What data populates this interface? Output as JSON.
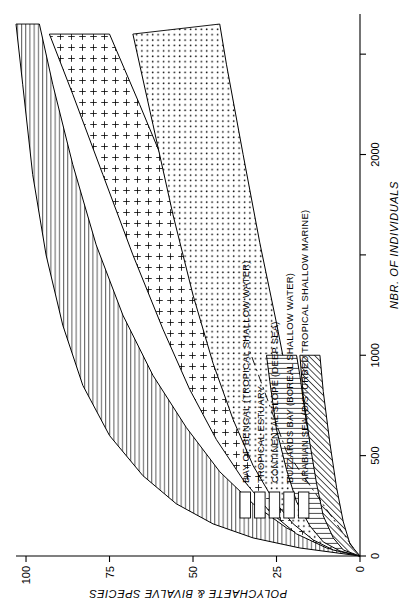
{
  "figure": {
    "title": "",
    "orientation": "rotated-90-ccw"
  },
  "chart_data": {
    "type": "line",
    "title": "",
    "subtitle": "",
    "xlabel": "NBR. OF INDIVIDUALS",
    "ylabel": "POLYCHAETE & BIVALVE SPECIES",
    "xlim": [
      0,
      2700
    ],
    "ylim": [
      0,
      103
    ],
    "grid": false,
    "legend_position": "inside-lower-left",
    "xticks": [
      0,
      500,
      1000,
      1500,
      2000,
      2500
    ],
    "xtick_labels": [
      "0",
      "500",
      "1000",
      "",
      "2000",
      ""
    ],
    "yticks": [
      0,
      25,
      50,
      75,
      100
    ],
    "ytick_labels": [
      "0",
      "25",
      "50",
      "75",
      "100"
    ],
    "series": [
      {
        "name": "BAY OF BENGAL (TROPICAL SHALLOW WATER)",
        "pattern": "horizontal-lines",
        "upper": [
          [
            0,
            0
          ],
          [
            40,
            18
          ],
          [
            90,
            32
          ],
          [
            160,
            44
          ],
          [
            260,
            55
          ],
          [
            400,
            65
          ],
          [
            600,
            75
          ],
          [
            850,
            83
          ],
          [
            1150,
            89
          ],
          [
            1500,
            94
          ],
          [
            1900,
            98
          ],
          [
            2350,
            101
          ],
          [
            2650,
            103
          ]
        ],
        "lower": [
          [
            0,
            0
          ],
          [
            60,
            12
          ],
          [
            140,
            22
          ],
          [
            260,
            32
          ],
          [
            420,
            42
          ],
          [
            640,
            52
          ],
          [
            900,
            62
          ],
          [
            1200,
            71
          ],
          [
            1550,
            79
          ],
          [
            1950,
            86
          ],
          [
            2350,
            92
          ],
          [
            2650,
            96
          ]
        ]
      },
      {
        "name": "TROPICAL ESTUARY",
        "pattern": "plus-signs",
        "upper": [
          [
            0,
            0
          ],
          [
            40,
            10
          ],
          [
            110,
            19
          ],
          [
            220,
            27
          ],
          [
            380,
            35
          ],
          [
            580,
            43
          ],
          [
            830,
            51
          ],
          [
            1130,
            59
          ],
          [
            1500,
            68
          ],
          [
            1900,
            77
          ],
          [
            2300,
            86
          ],
          [
            2600,
            93
          ]
        ],
        "lower": [
          [
            0,
            0
          ],
          [
            70,
            7
          ],
          [
            180,
            13
          ],
          [
            340,
            19
          ],
          [
            550,
            25
          ],
          [
            800,
            32
          ],
          [
            1100,
            39
          ],
          [
            1450,
            47
          ],
          [
            1850,
            56
          ],
          [
            2250,
            66
          ],
          [
            2600,
            75
          ]
        ]
      },
      {
        "name": "CONTINENTAL SLOPE (DEEP SEA)",
        "pattern": "dots",
        "upper": [
          [
            0,
            0
          ],
          [
            30,
            8
          ],
          [
            80,
            14
          ],
          [
            160,
            20
          ],
          [
            280,
            26
          ],
          [
            450,
            32
          ],
          [
            680,
            38
          ],
          [
            960,
            44
          ],
          [
            1300,
            50
          ],
          [
            1700,
            56
          ],
          [
            2150,
            62
          ],
          [
            2600,
            68
          ]
        ],
        "lower": [
          [
            0,
            0
          ],
          [
            60,
            5
          ],
          [
            160,
            9
          ],
          [
            320,
            13
          ],
          [
            540,
            17
          ],
          [
            820,
            21
          ],
          [
            1160,
            25
          ],
          [
            1560,
            30
          ],
          [
            2000,
            35
          ],
          [
            2450,
            40
          ],
          [
            2650,
            42
          ]
        ]
      },
      {
        "name": "BUZZARDS BAY (BOREAL SHALLOW WATER)",
        "pattern": "vertical-lines",
        "upper": [
          [
            0,
            0
          ],
          [
            25,
            6
          ],
          [
            70,
            11
          ],
          [
            150,
            15
          ],
          [
            270,
            19
          ],
          [
            430,
            22
          ],
          [
            630,
            25
          ],
          [
            870,
            27
          ],
          [
            1000,
            28
          ]
        ],
        "lower": [
          [
            0,
            0
          ],
          [
            50,
            4
          ],
          [
            130,
            7
          ],
          [
            260,
            10
          ],
          [
            440,
            13
          ],
          [
            660,
            16
          ],
          [
            900,
            18
          ],
          [
            1000,
            19
          ]
        ]
      },
      {
        "name": "ARABIAN SEA (DISTURBED TROPICAL SHALLOW MARINE)",
        "pattern": "diagonal-hatch",
        "upper": [
          [
            0,
            0
          ],
          [
            30,
            5
          ],
          [
            90,
            8
          ],
          [
            200,
            11
          ],
          [
            360,
            13
          ],
          [
            560,
            15
          ],
          [
            800,
            17
          ],
          [
            1000,
            18
          ]
        ],
        "lower": [
          [
            0,
            0
          ],
          [
            60,
            3
          ],
          [
            170,
            5
          ],
          [
            340,
            7
          ],
          [
            560,
            9
          ],
          [
            820,
            11
          ],
          [
            1000,
            12
          ]
        ]
      }
    ]
  },
  "axes": {
    "x": {
      "label": "NBR. OF INDIVIDUALS",
      "ticks": [
        {
          "value": 0,
          "label": "0"
        },
        {
          "value": 500,
          "label": "500"
        },
        {
          "value": 1000,
          "label": "1000"
        },
        {
          "value": 1500,
          "label": ""
        },
        {
          "value": 2000,
          "label": "2000"
        },
        {
          "value": 2500,
          "label": ""
        }
      ]
    },
    "y": {
      "label": "POLYCHAETE & BIVALVE SPECIES",
      "ticks": [
        {
          "value": 0,
          "label": "0"
        },
        {
          "value": 25,
          "label": "25"
        },
        {
          "value": 50,
          "label": "50"
        },
        {
          "value": 75,
          "label": "75"
        },
        {
          "value": 100,
          "label": "100"
        }
      ]
    }
  },
  "legend": {
    "items": [
      {
        "label": "BAY OF BENGAL (TROPICAL SHALLOW WATER)",
        "pattern": "horizontal-lines"
      },
      {
        "label": "TROPICAL ESTUARY",
        "pattern": "vertical-lines"
      },
      {
        "label": "CONTINENTAL SLOPE (DEEP SEA)",
        "pattern": "plus-signs"
      },
      {
        "label": "BUZZARDS BAY (BOREAL SHALLOW WATER)",
        "pattern": "dots"
      },
      {
        "label": "ARABIAN SEA (DISTURBED TROPICAL SHALLOW MARINE)",
        "pattern": "diagonal-hatch"
      }
    ]
  },
  "colors": {
    "ink": "#000000",
    "paper": "#ffffff"
  }
}
